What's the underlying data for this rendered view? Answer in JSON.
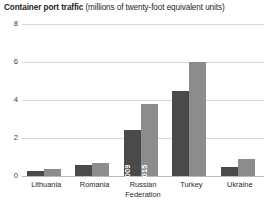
{
  "title": {
    "main": "Container port traffic ",
    "sub": "(millions of twenty-foot equivalent units)"
  },
  "chart_data": {
    "type": "bar",
    "title": "Container port traffic (millions of twenty-foot equivalent units)",
    "xlabel": "",
    "ylabel": "",
    "ylim": [
      0,
      8
    ],
    "yticks": [
      "0",
      "2",
      "4",
      "6",
      "8"
    ],
    "grid": true,
    "legend": "in-bar labels on Russian Federation group",
    "categories": [
      "Lithuania",
      "Romania",
      "Russian Federation",
      "Turkey",
      "Ukraine"
    ],
    "category_lines": [
      [
        "Lithuania"
      ],
      [
        "Romania"
      ],
      [
        "Russian",
        "Federation"
      ],
      [
        "Turkey"
      ],
      [
        "Ukraine"
      ]
    ],
    "series": [
      {
        "name": "2009",
        "color": "#4a4a4a",
        "values": [
          0.25,
          0.6,
          2.4,
          4.5,
          0.5
        ]
      },
      {
        "name": "2015",
        "color": "#8c8c8c",
        "values": [
          0.35,
          0.7,
          3.8,
          6.0,
          0.9
        ]
      }
    ],
    "bar_labels": {
      "group": "Russian Federation",
      "series_0": "2009",
      "series_1": "2015"
    }
  },
  "colors": {
    "series_2009": "#4a4a4a",
    "series_2015": "#8c8c8c",
    "gridline": "#d8d8d8",
    "baseline": "#b9b9b9",
    "text": "#231f20"
  }
}
